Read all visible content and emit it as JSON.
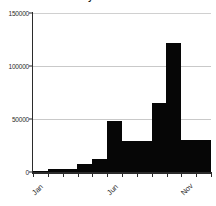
{
  "chart_data": {
    "type": "bar",
    "title": "US monthly casualties in WWII",
    "xlabel": "",
    "ylabel": "",
    "categories": [
      "Jan",
      "Feb",
      "Mar",
      "Apr",
      "May",
      "Jun",
      "Jul",
      "Aug",
      "Sep",
      "Oct",
      "Nov",
      "Dec"
    ],
    "values": [
      1000,
      3000,
      2500,
      8000,
      12000,
      48000,
      29000,
      29000,
      65000,
      122000,
      30000,
      30000
    ],
    "ylim": [
      0,
      150000
    ],
    "ytick_labels": [
      "0",
      "50000",
      "100000",
      "150000"
    ],
    "ytick_values": [
      0,
      50000,
      100000,
      150000
    ],
    "xtick_labels": [
      "Jan",
      "Jun",
      "Nov"
    ],
    "xtick_indices": [
      0,
      5,
      10
    ],
    "grid": true,
    "legend": "none",
    "bar_color": "#060606",
    "grid_color": "#c9c9c9",
    "axis_color": "#2b2b2b"
  }
}
